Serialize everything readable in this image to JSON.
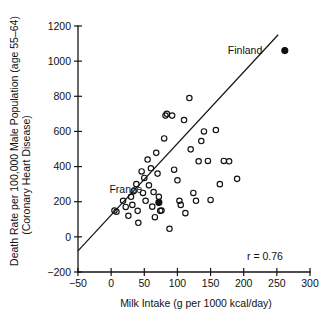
{
  "chart_data": {
    "type": "scatter",
    "title": "",
    "xlabel": "Milk Intake (g per 1000 kcal/day)",
    "ylabel": "Death Rate per 100,000 Male Population (age 55-64) (Coronary Heart Disease)",
    "ylabel_line1": "Death Rate per 100,000 Male Population (age 55–64)",
    "ylabel_line2": "(Coronary Heart Disease)",
    "xlim": [
      -50,
      300
    ],
    "ylim": [
      -200,
      1200
    ],
    "xticks": [
      -50,
      0,
      50,
      100,
      150,
      200,
      250,
      300
    ],
    "xtick_labels": [
      "−50",
      "0",
      "50",
      "100",
      "150",
      "200",
      "250",
      "300"
    ],
    "yticks": [
      -200,
      0,
      200,
      400,
      600,
      800,
      1000,
      1200
    ],
    "ytick_labels": [
      "−200",
      "0",
      "200",
      "400",
      "600",
      "800",
      "1000",
      "1200"
    ],
    "grid": false,
    "legend": null,
    "annotations": [
      {
        "text": "Finland",
        "x": 228,
        "y": 1060,
        "anchor": "end"
      },
      {
        "text": "France",
        "x": 22,
        "y": 268,
        "anchor": "middle"
      },
      {
        "text": "r = 0.76",
        "x": 232,
        "y": -110,
        "anchor": "middle"
      }
    ],
    "correlation": 0.76,
    "trend_line": {
      "x0": -50,
      "y0": -80,
      "x1": 252,
      "y1": 1150
    },
    "series": [
      {
        "name": "Countries (open markers)",
        "marker": "open-circle",
        "points": [
          [
            5,
            150
          ],
          [
            8,
            143
          ],
          [
            18,
            205
          ],
          [
            22,
            170
          ],
          [
            26,
            120
          ],
          [
            30,
            228
          ],
          [
            32,
            182
          ],
          [
            34,
            260
          ],
          [
            38,
            300
          ],
          [
            40,
            148
          ],
          [
            41,
            80
          ],
          [
            46,
            372
          ],
          [
            48,
            250
          ],
          [
            50,
            335
          ],
          [
            52,
            205
          ],
          [
            55,
            440
          ],
          [
            57,
            293
          ],
          [
            60,
            390
          ],
          [
            62,
            172
          ],
          [
            64,
            255
          ],
          [
            66,
            112
          ],
          [
            68,
            478
          ],
          [
            70,
            360
          ],
          [
            72,
            228
          ],
          [
            74,
            148
          ],
          [
            76,
            150
          ],
          [
            80,
            560
          ],
          [
            82,
            690
          ],
          [
            84,
            700
          ],
          [
            88,
            46
          ],
          [
            92,
            690
          ],
          [
            95,
            382
          ],
          [
            100,
            322
          ],
          [
            103,
            205
          ],
          [
            105,
            182
          ],
          [
            110,
            665
          ],
          [
            112,
            135
          ],
          [
            118,
            790
          ],
          [
            120,
            498
          ],
          [
            124,
            250
          ],
          [
            128,
            205
          ],
          [
            132,
            430
          ],
          [
            136,
            545
          ],
          [
            140,
            600
          ],
          [
            146,
            432
          ],
          [
            150,
            210
          ],
          [
            158,
            608
          ],
          [
            164,
            300
          ],
          [
            170,
            432
          ],
          [
            178,
            430
          ],
          [
            190,
            330
          ]
        ]
      },
      {
        "name": "Highlighted countries (filled markers)",
        "marker": "filled-circle",
        "points": [
          [
            72,
            196
          ],
          [
            262,
            1060
          ]
        ]
      }
    ]
  }
}
